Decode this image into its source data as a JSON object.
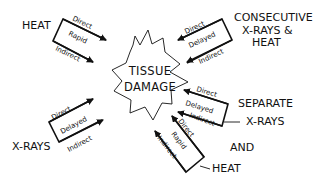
{
  "diagram": {
    "center": {
      "line1": "TISSUE",
      "line2": "DAMAGE"
    },
    "sources": {
      "heat": {
        "label": "HEAT",
        "arrows": {
          "top": "Direct",
          "middle": "Rapid",
          "bottom": "Indirect"
        }
      },
      "consecutive": {
        "line1": "CONSECUTIVE",
        "line2": "X-RAYS  &",
        "line3": "HEAT",
        "arrows": {
          "top": "Direct",
          "middle": "Delayed",
          "bottom": "Indirect"
        }
      },
      "xrays": {
        "label": "X-RAYS",
        "arrows": {
          "top": "Direct",
          "middle": "Delayed",
          "bottom": "Indirect"
        }
      },
      "separate": {
        "line1": "SEPARATE",
        "line2": "X-RAYS",
        "line3": "AND",
        "line4": "HEAT",
        "xray_arrows": {
          "top": "Direct",
          "middle": "Delayed",
          "bottom": "Indirect"
        },
        "heat_arrows": {
          "top": "Direct",
          "middle": "Rapid",
          "bottom": "Indirect"
        }
      }
    },
    "colors": {
      "ink": "#111111",
      "background": "#ffffff"
    }
  }
}
